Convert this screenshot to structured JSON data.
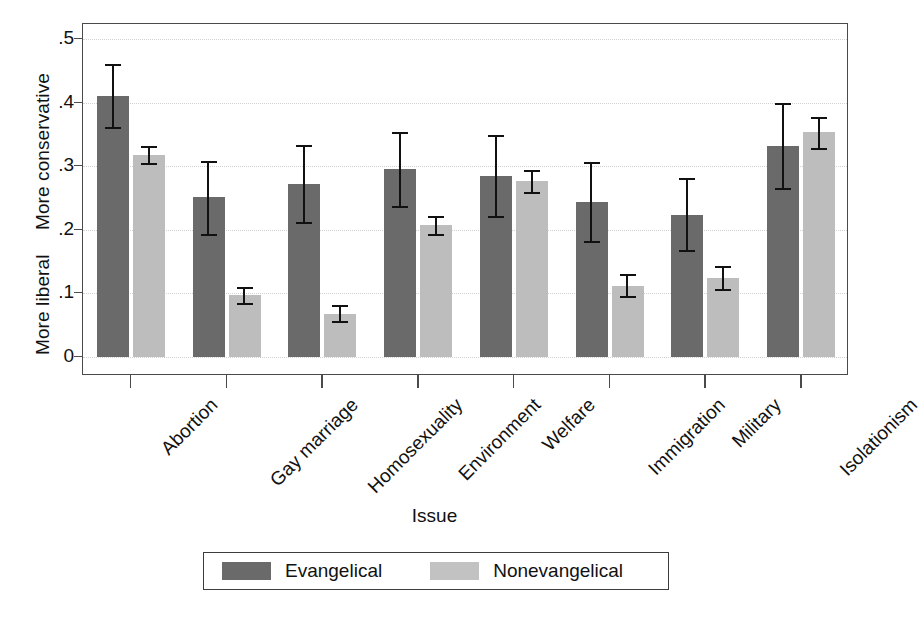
{
  "chart_data": {
    "type": "bar",
    "title": "",
    "xlabel": "Issue",
    "ylabel": "",
    "ylabel_top": "More conservative",
    "ylabel_bottom": "More liberal",
    "categories": [
      "Abortion",
      "Gay marriage",
      "Homosexuality",
      "Environment",
      "Welfare",
      "Immigration",
      "Military",
      "Isolationism"
    ],
    "ylim": [
      0,
      0.5
    ],
    "ytick_labels": [
      "0",
      ".1",
      ".2",
      ".3",
      ".4",
      ".5"
    ],
    "ytick_values": [
      0,
      0.1,
      0.2,
      0.3,
      0.4,
      0.5
    ],
    "grid": true,
    "grid_style": "dotted-horizontal",
    "legend_position": "below-plot",
    "error_bars": "95% confidence interval",
    "series": [
      {
        "name": "Evangelical",
        "color": "#6a6a6a",
        "values": [
          0.411,
          0.251,
          0.272,
          0.296,
          0.285,
          0.244,
          0.224,
          0.332
        ],
        "ci_low": [
          0.362,
          0.193,
          0.212,
          0.238,
          0.221,
          0.183,
          0.168,
          0.265
        ],
        "ci_high": [
          0.461,
          0.308,
          0.334,
          0.354,
          0.349,
          0.307,
          0.281,
          0.4
        ]
      },
      {
        "name": "Nonevangelical",
        "color": "#bdbdbd",
        "values": [
          0.318,
          0.097,
          0.068,
          0.207,
          0.277,
          0.112,
          0.125,
          0.353
        ],
        "ci_low": [
          0.305,
          0.085,
          0.057,
          0.193,
          0.26,
          0.096,
          0.107,
          0.328
        ],
        "ci_high": [
          0.332,
          0.11,
          0.081,
          0.222,
          0.294,
          0.13,
          0.143,
          0.378
        ]
      }
    ]
  },
  "legend": {
    "entries": [
      {
        "label": "Evangelical"
      },
      {
        "label": "Nonevangelical"
      }
    ]
  },
  "axis": {
    "x_title": "Issue",
    "y_title_upper": "More conservative",
    "y_title_lower": "More liberal"
  }
}
